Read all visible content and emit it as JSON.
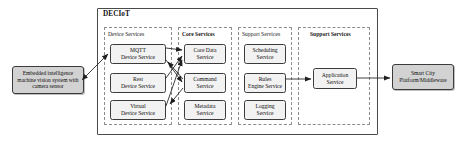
{
  "diagram": {
    "title": "DECIoT",
    "groups": [
      {
        "id": "device",
        "label": "Device Services"
      },
      {
        "id": "core",
        "label": "Core Services"
      },
      {
        "id": "support1",
        "label": "Support Services"
      },
      {
        "id": "support2",
        "label": "Support Services"
      }
    ],
    "nodes": {
      "mqtt": {
        "line1": "MQTT",
        "line2": "Device Service"
      },
      "rest": {
        "line1": "Rest",
        "line2": "Device Service"
      },
      "virtual": {
        "line1": "Virtual",
        "line2": "Device Service"
      },
      "core_data": {
        "line1": "Core Data",
        "line2": "Service"
      },
      "command": {
        "line1": "Command",
        "line2": "Service"
      },
      "metadata": {
        "line1": "Metadata",
        "line2": "Service"
      },
      "scheduling": {
        "line1": "Scheduling",
        "line2": "Service"
      },
      "rules": {
        "line1": "Rules",
        "line2": "Engine Service"
      },
      "logging": {
        "line1": "Logging",
        "line2": "Service"
      },
      "application": {
        "line1": "Application",
        "line2": "Service"
      }
    },
    "external": {
      "embedded": {
        "line1": "Embedded intelligence",
        "line2": "machine vision system",
        "line3": "with camera sensor"
      },
      "smart_city": {
        "line1": "Smart City",
        "line2": "Platform/Middleware"
      }
    },
    "connections": [
      {
        "from": "embedded",
        "to": "mqtt",
        "type": "bidirectional"
      },
      {
        "from": "mqtt",
        "to": "core_data",
        "type": "directed"
      },
      {
        "from": "mqtt",
        "to": "command",
        "type": "directed"
      },
      {
        "from": "rest",
        "to": "core_data",
        "type": "directed"
      },
      {
        "from": "virtual",
        "to": "core_data",
        "type": "directed"
      },
      {
        "from": "command",
        "to": "mqtt",
        "type": "directed"
      },
      {
        "from": "command",
        "to": "virtual",
        "type": "directed"
      },
      {
        "from": "rules",
        "to": "application",
        "type": "directed"
      },
      {
        "from": "application",
        "to": "smart_city",
        "type": "directed"
      }
    ],
    "colors": {
      "frame_border": "#4a4a4a",
      "group_border": "#8c8c8c",
      "node_fill": "#f2f2f2",
      "node_border": "#3b3b3b",
      "external_fill": "#d2d2d2",
      "arrow": "#1f1f1f",
      "background": "#ffffff"
    }
  }
}
